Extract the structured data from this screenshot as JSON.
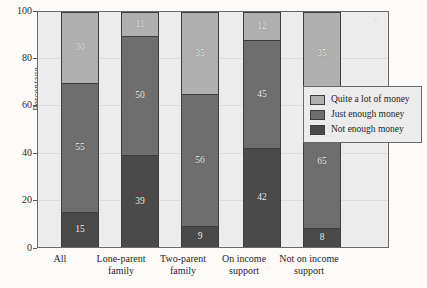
{
  "chart_data": {
    "type": "bar",
    "stacked": true,
    "title": "",
    "xlabel": "",
    "ylabel": "Percentage",
    "ylim": [
      0,
      100
    ],
    "yticks": [
      0,
      20,
      40,
      60,
      80,
      100
    ],
    "ytick_labels": [
      "0",
      "20",
      "40",
      "60",
      "80",
      "100"
    ],
    "grid": true,
    "legend_position": "right",
    "categories": [
      "All",
      "Lone-parent family",
      "Two-parent family",
      "On income support",
      "Not on income support"
    ],
    "category_lines": [
      [
        "All"
      ],
      [
        "Lone-parent",
        "family"
      ],
      [
        "Two-parent",
        "family"
      ],
      [
        "On income",
        "support"
      ],
      [
        "Not on income",
        "support"
      ]
    ],
    "series": [
      {
        "name": "Not enough money",
        "color": "#4a4a4a",
        "values": [
          15,
          39,
          9,
          42,
          8
        ]
      },
      {
        "name": "Just enough money",
        "color": "#6e6e6e",
        "values": [
          55,
          50,
          56,
          45,
          65
        ]
      },
      {
        "name": "Quite a lot of money",
        "color": "#b0b0b0",
        "values": [
          30,
          11,
          35,
          12,
          35
        ]
      }
    ],
    "rendered_heights": {
      "note": "drawn segment extents as a share of the 0-100 axis",
      "Not enough money": [
        15,
        39,
        9,
        42,
        8
      ],
      "Just enough money": [
        55,
        51,
        56,
        46,
        57
      ],
      "Quite a lot of money": [
        30,
        10,
        35,
        12,
        35
      ]
    }
  },
  "legend": {
    "items": [
      {
        "label": "Quite a lot of money",
        "color": "#b0b0b0"
      },
      {
        "label": "Just enough money",
        "color": "#6e6e6e"
      },
      {
        "label": "Not enough money",
        "color": "#4a4a4a"
      }
    ]
  },
  "colors": {
    "plot_background": "#ececec",
    "page_background": "#fcfbfa",
    "frame": "#6a6a6a",
    "gridline": "#dcdcdc",
    "bar_outline": "#3d3d3d",
    "label_text": "#f4f4f4"
  }
}
